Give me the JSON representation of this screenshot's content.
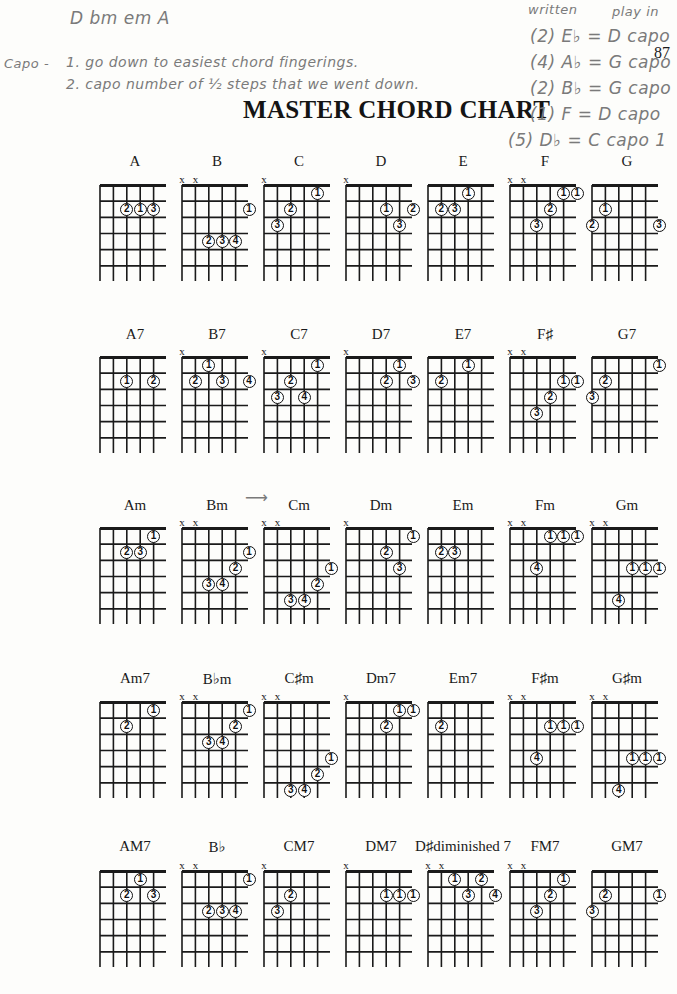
{
  "page": {
    "title": "MASTER CHORD CHART",
    "page_number": "87"
  },
  "handwritten_notes": {
    "top_line": "D  bm  em  A",
    "capo_label": "Capo -",
    "step1": "1. go down to easiest chord fingerings.",
    "step2": "2. capo number of ½ steps  that we went down.",
    "header_written": "written",
    "header_play": "play in",
    "transpositions": [
      {
        "written": "(2) E♭",
        "eq": "=",
        "play": "D capo"
      },
      {
        "written": "(4) A♭",
        "eq": "=",
        "play": "G capo"
      },
      {
        "written": "(2) B♭",
        "eq": "=",
        "play": "G capo"
      },
      {
        "written": "(1) F",
        "eq": "=",
        "play": "D capo"
      },
      {
        "written": "(5) D♭",
        "eq": "=",
        "play": "C capo 1"
      }
    ],
    "margin_right": "T... Th... po... c",
    "arrow_bm_cm": "⟶"
  },
  "chart": {
    "strings": 6,
    "frets": 6,
    "rows": [
      {
        "label_y": 153,
        "grid_y": 185,
        "chords": [
          {
            "name": "A",
            "mutes": [],
            "dots": [
              [
                2,
                2,
                "2"
              ],
              [
                3,
                2,
                "1"
              ],
              [
                4,
                2,
                "3"
              ]
            ]
          },
          {
            "name": "B",
            "mutes": [
              0,
              1
            ],
            "dots": [
              [
                5,
                2,
                "1"
              ],
              [
                2,
                4,
                "2"
              ],
              [
                3,
                4,
                "3"
              ],
              [
                4,
                4,
                "4"
              ]
            ]
          },
          {
            "name": "C",
            "mutes": [
              0
            ],
            "dots": [
              [
                4,
                1,
                "1"
              ],
              [
                2,
                2,
                "2"
              ],
              [
                1,
                3,
                "3"
              ]
            ]
          },
          {
            "name": "D",
            "mutes": [
              0
            ],
            "dots": [
              [
                3,
                2,
                "1"
              ],
              [
                5,
                2,
                "2"
              ],
              [
                4,
                3,
                "3"
              ]
            ]
          },
          {
            "name": "E",
            "mutes": [],
            "dots": [
              [
                3,
                1,
                "1"
              ],
              [
                1,
                2,
                "2"
              ],
              [
                2,
                2,
                "3"
              ]
            ]
          },
          {
            "name": "F",
            "mutes": [
              0,
              1
            ],
            "dots": [
              [
                4,
                1,
                "1"
              ],
              [
                5,
                1,
                "1"
              ],
              [
                3,
                2,
                "2"
              ],
              [
                2,
                3,
                "3"
              ]
            ]
          },
          {
            "name": "G",
            "mutes": [],
            "dots": [
              [
                1,
                2,
                "1"
              ],
              [
                0,
                3,
                "2"
              ],
              [
                5,
                3,
                "3"
              ]
            ]
          }
        ]
      },
      {
        "label_y": 326,
        "grid_y": 357,
        "chords": [
          {
            "name": "A7",
            "mutes": [],
            "dots": [
              [
                2,
                2,
                "1"
              ],
              [
                4,
                2,
                "2"
              ]
            ]
          },
          {
            "name": "B7",
            "mutes": [
              0
            ],
            "dots": [
              [
                2,
                1,
                "1"
              ],
              [
                1,
                2,
                "2"
              ],
              [
                3,
                2,
                "3"
              ],
              [
                5,
                2,
                "4"
              ]
            ]
          },
          {
            "name": "C7",
            "mutes": [
              0
            ],
            "dots": [
              [
                4,
                1,
                "1"
              ],
              [
                2,
                2,
                "2"
              ],
              [
                1,
                3,
                "3"
              ],
              [
                3,
                3,
                "4"
              ]
            ]
          },
          {
            "name": "D7",
            "mutes": [
              0
            ],
            "dots": [
              [
                4,
                1,
                "1"
              ],
              [
                3,
                2,
                "2"
              ],
              [
                5,
                2,
                "3"
              ]
            ]
          },
          {
            "name": "E7",
            "mutes": [],
            "dots": [
              [
                3,
                1,
                "1"
              ],
              [
                1,
                2,
                "2"
              ]
            ]
          },
          {
            "name": "F♯",
            "mutes": [
              0,
              1
            ],
            "dots": [
              [
                4,
                2,
                "1"
              ],
              [
                5,
                2,
                "1"
              ],
              [
                3,
                3,
                "2"
              ],
              [
                2,
                4,
                "3"
              ]
            ]
          },
          {
            "name": "G7",
            "mutes": [],
            "dots": [
              [
                5,
                1,
                "1"
              ],
              [
                1,
                2,
                "2"
              ],
              [
                0,
                3,
                "3"
              ]
            ]
          }
        ]
      },
      {
        "label_y": 497,
        "grid_y": 528,
        "chords": [
          {
            "name": "Am",
            "mutes": [],
            "dots": [
              [
                4,
                1,
                "1"
              ],
              [
                2,
                2,
                "2"
              ],
              [
                3,
                2,
                "3"
              ]
            ]
          },
          {
            "name": "Bm",
            "mutes": [
              0,
              1
            ],
            "dots": [
              [
                5,
                2,
                "1"
              ],
              [
                4,
                3,
                "2"
              ],
              [
                2,
                4,
                "3"
              ],
              [
                3,
                4,
                "4"
              ]
            ]
          },
          {
            "name": "Cm",
            "mutes": [
              0,
              1
            ],
            "dots": [
              [
                5,
                3,
                "1"
              ],
              [
                4,
                4,
                "2"
              ],
              [
                2,
                5,
                "3"
              ],
              [
                3,
                5,
                "4"
              ]
            ]
          },
          {
            "name": "Dm",
            "mutes": [
              0
            ],
            "dots": [
              [
                5,
                1,
                "1"
              ],
              [
                3,
                2,
                "2"
              ],
              [
                4,
                3,
                "3"
              ]
            ]
          },
          {
            "name": "Em",
            "mutes": [],
            "dots": [
              [
                1,
                2,
                "2"
              ],
              [
                2,
                2,
                "3"
              ]
            ]
          },
          {
            "name": "Fm",
            "mutes": [
              0,
              1
            ],
            "dots": [
              [
                3,
                1,
                "1"
              ],
              [
                4,
                1,
                "1"
              ],
              [
                5,
                1,
                "1"
              ],
              [
                2,
                3,
                "4"
              ]
            ]
          },
          {
            "name": "Gm",
            "mutes": [
              0,
              1
            ],
            "dots": [
              [
                3,
                3,
                "1"
              ],
              [
                4,
                3,
                "1"
              ],
              [
                5,
                3,
                "1"
              ],
              [
                2,
                5,
                "4"
              ]
            ]
          }
        ]
      },
      {
        "label_y": 670,
        "grid_y": 702,
        "chords": [
          {
            "name": "Am7",
            "mutes": [],
            "dots": [
              [
                4,
                1,
                "1"
              ],
              [
                2,
                2,
                "2"
              ]
            ]
          },
          {
            "name": "B♭m",
            "mutes": [
              0,
              1
            ],
            "dots": [
              [
                5,
                1,
                "1"
              ],
              [
                4,
                2,
                "2"
              ],
              [
                2,
                3,
                "3"
              ],
              [
                3,
                3,
                "4"
              ]
            ]
          },
          {
            "name": "C♯m",
            "mutes": [
              0,
              1
            ],
            "dots": [
              [
                5,
                4,
                "1"
              ],
              [
                4,
                5,
                "2"
              ],
              [
                2,
                6,
                "3"
              ],
              [
                3,
                6,
                "4"
              ]
            ]
          },
          {
            "name": "Dm7",
            "mutes": [
              0
            ],
            "dots": [
              [
                4,
                1,
                "1"
              ],
              [
                5,
                1,
                "1"
              ],
              [
                3,
                2,
                "2"
              ]
            ]
          },
          {
            "name": "Em7",
            "mutes": [],
            "dots": [
              [
                1,
                2,
                "2"
              ]
            ]
          },
          {
            "name": "F♯m",
            "mutes": [
              0,
              1
            ],
            "dots": [
              [
                3,
                2,
                "1"
              ],
              [
                4,
                2,
                "1"
              ],
              [
                5,
                2,
                "1"
              ],
              [
                2,
                4,
                "4"
              ]
            ]
          },
          {
            "name": "G♯m",
            "mutes": [
              0,
              1
            ],
            "dots": [
              [
                3,
                4,
                "1"
              ],
              [
                4,
                4,
                "1"
              ],
              [
                5,
                4,
                "1"
              ],
              [
                2,
                6,
                "4"
              ]
            ]
          }
        ]
      },
      {
        "label_y": 838,
        "grid_y": 871,
        "chords": [
          {
            "name": "AM7",
            "mutes": [],
            "dots": [
              [
                3,
                1,
                "1"
              ],
              [
                2,
                2,
                "2"
              ],
              [
                4,
                2,
                "3"
              ]
            ]
          },
          {
            "name": "B♭",
            "mutes": [
              0,
              1
            ],
            "dots": [
              [
                5,
                1,
                "1"
              ],
              [
                2,
                3,
                "2"
              ],
              [
                3,
                3,
                "3"
              ],
              [
                4,
                3,
                "4"
              ]
            ]
          },
          {
            "name": "CM7",
            "mutes": [
              0
            ],
            "dots": [
              [
                2,
                2,
                "2"
              ],
              [
                1,
                3,
                "3"
              ]
            ]
          },
          {
            "name": "DM7",
            "mutes": [
              0
            ],
            "dots": [
              [
                3,
                2,
                "1"
              ],
              [
                4,
                2,
                "1"
              ],
              [
                5,
                2,
                "1"
              ]
            ]
          },
          {
            "name": "D♯diminished 7",
            "mutes": [
              0,
              1
            ],
            "dots": [
              [
                2,
                1,
                "1"
              ],
              [
                4,
                1,
                "2"
              ],
              [
                3,
                2,
                "3"
              ],
              [
                5,
                2,
                "4"
              ]
            ]
          },
          {
            "name": "FM7",
            "mutes": [
              0,
              1
            ],
            "dots": [
              [
                4,
                1,
                "1"
              ],
              [
                3,
                2,
                "2"
              ],
              [
                2,
                3,
                "3"
              ]
            ]
          },
          {
            "name": "GM7",
            "mutes": [],
            "dots": [
              [
                1,
                2,
                "2"
              ],
              [
                5,
                2,
                "1"
              ],
              [
                0,
                3,
                "3"
              ]
            ]
          }
        ]
      }
    ],
    "column_x": [
      100,
      182,
      264,
      346,
      428,
      510,
      592
    ]
  }
}
